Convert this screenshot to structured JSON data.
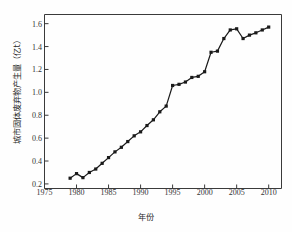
{
  "chart_data": {
    "type": "line",
    "title": "",
    "xlabel": "年份",
    "ylabel": "城市固体废弃物产生量（亿t）",
    "xlim": [
      1975,
      2012
    ],
    "ylim": [
      0.16,
      1.68
    ],
    "grid": false,
    "legend": null,
    "marker": "filled-square",
    "line_color": "#1a1a1a",
    "marker_color": "#1a1a1a",
    "xticks": [
      1975,
      1980,
      1985,
      1990,
      1995,
      2000,
      2005,
      2010
    ],
    "xtick_labels": [
      "1975",
      "1980",
      "1985",
      "1990",
      "1995",
      "2000",
      "2005",
      "2010"
    ],
    "yticks": [
      0.2,
      0.4,
      0.6,
      0.8,
      1.0,
      1.2,
      1.4,
      1.6
    ],
    "ytick_labels": [
      "0.2",
      "0.4",
      "0.6",
      "0.8",
      "1.0",
      "1.2",
      "1.4",
      "1.6"
    ],
    "x": [
      1979,
      1980,
      1981,
      1982,
      1983,
      1984,
      1985,
      1986,
      1987,
      1988,
      1989,
      1990,
      1991,
      1992,
      1993,
      1994,
      1995,
      1996,
      1997,
      1998,
      1999,
      2000,
      2001,
      2002,
      2003,
      2004,
      2005,
      2006,
      2007,
      2008,
      2009,
      2010
    ],
    "values": [
      0.25,
      0.29,
      0.255,
      0.3,
      0.33,
      0.38,
      0.43,
      0.48,
      0.52,
      0.57,
      0.62,
      0.655,
      0.71,
      0.76,
      0.83,
      0.88,
      1.06,
      1.07,
      1.09,
      1.13,
      1.14,
      1.18,
      1.35,
      1.36,
      1.47,
      1.545,
      1.555,
      1.47,
      1.5,
      1.52,
      1.545,
      1.57
    ],
    "series_name": "城市固体废弃物产生量"
  },
  "figure": {
    "background_color": "#ffffff",
    "axis_color": "#3a3a3a",
    "text_color": "#2a2a2a"
  }
}
